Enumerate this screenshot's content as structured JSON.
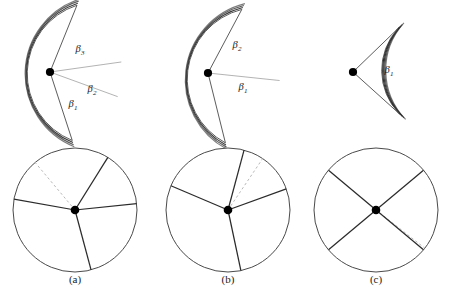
{
  "figure": {
    "title": "",
    "background_color": "#ffffff",
    "stroke_color": "#4a4a4a",
    "dark_stroke_color": "#2b2b2b",
    "dashed_color": "#b9b9b9",
    "vertex_color": "#000000",
    "panels": [
      {
        "id": "a",
        "caption": "(a)",
        "fan": {
          "apex": [
            50,
            72
          ],
          "radius": 72,
          "start_angle_deg": -72,
          "end_angle_deg": 68,
          "layers": 3,
          "sector_labels": [
            {
              "text": "β",
              "sub": "3",
              "x": 80,
              "y": 52
            },
            {
              "text": "β",
              "sub": "2",
              "x": 92,
              "y": 92
            },
            {
              "text": "β",
              "sub": "1",
              "x": 73,
              "y": 107
            }
          ],
          "crease_angles_deg": [
            -20,
            8
          ]
        },
        "circle": {
          "center": [
            75,
            210
          ],
          "radius": 62,
          "solid_radii_deg": [
            -75,
            6,
            58,
            170
          ],
          "dashed_radii_deg": [
            130
          ]
        }
      },
      {
        "id": "b",
        "caption": "(b)",
        "fan": {
          "apex": [
            208,
            73
          ],
          "radius": 72,
          "start_angle_deg": -76,
          "end_angle_deg": 62,
          "layers": 3,
          "sector_labels": [
            {
              "text": "β",
              "sub": "2",
              "x": 237,
              "y": 48
            },
            {
              "text": "β",
              "sub": "1",
              "x": 243,
              "y": 90
            }
          ],
          "crease_angles_deg": [
            -6
          ]
        },
        "circle": {
          "center": [
            228,
            210
          ],
          "radius": 62,
          "solid_radii_deg": [
            -78,
            20,
            75,
            157
          ],
          "dashed_radii_deg": [
            56
          ]
        }
      },
      {
        "id": "c",
        "caption": "(c)",
        "fan": {
          "apex": [
            353,
            72
          ],
          "radius": 62,
          "start_angle_deg": -42,
          "end_angle_deg": 44,
          "layers": 4,
          "sector_labels": [
            {
              "text": "β",
              "sub": "1",
              "x": 389,
              "y": 73
            }
          ],
          "crease_angles_deg": []
        },
        "circle": {
          "center": [
            376,
            210
          ],
          "radius": 62,
          "solid_radii_deg": [
            -40,
            40,
            140,
            220
          ],
          "dashed_radii_deg": [
            -38
          ]
        }
      }
    ],
    "caption_y": 283,
    "caption_positions": [
      {
        "id": "a",
        "x": 75
      },
      {
        "id": "b",
        "x": 228
      },
      {
        "id": "c",
        "x": 376
      }
    ]
  }
}
